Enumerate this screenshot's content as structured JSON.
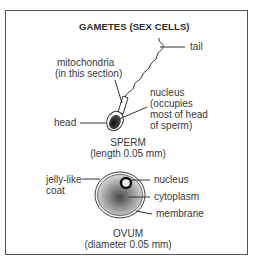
{
  "title": "GAMETES (SEX CELLS)",
  "sperm": {
    "labels": {
      "tail": "tail",
      "mitochondria_line1": "mitochondria",
      "mitochondria_line2": "(in this section)",
      "nucleus_line1": "nucleus",
      "nucleus_line2": "(occupies",
      "nucleus_line3": "most of head",
      "nucleus_line4": "of sperm)",
      "head": "head"
    },
    "caption": "SPERM",
    "size": "(length 0.05 mm)"
  },
  "ovum": {
    "labels": {
      "coat_line1": "jelly-like",
      "coat_line2": "coat",
      "nucleus": "nucleus",
      "cytoplasm": "cytoplasm",
      "membrane": "membrane"
    },
    "caption": "OVUM",
    "size": "(diameter 0.05 mm)"
  },
  "colors": {
    "frame": "#555555",
    "line": "#333333",
    "nucleus_dark": "#222222",
    "cytoplasm_light": "#cfcfcf",
    "cytoplasm_dark": "#555555"
  }
}
